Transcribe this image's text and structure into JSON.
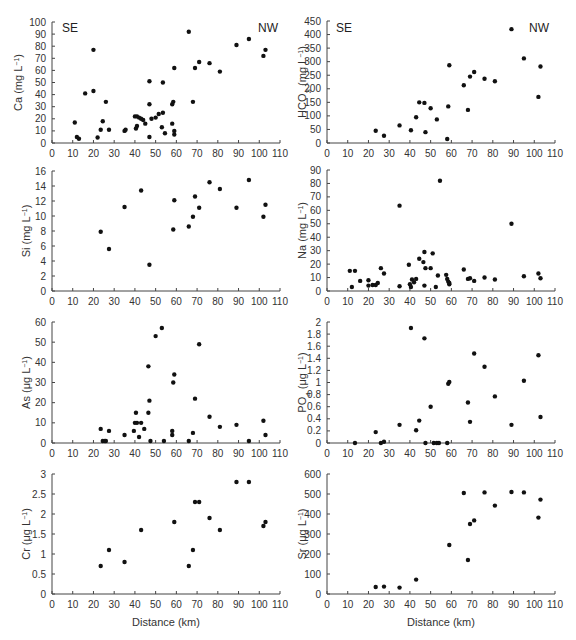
{
  "figure": {
    "xlabel": "Distance (km)",
    "corner_labels": {
      "left": "SE",
      "right": "NW"
    }
  },
  "chart_data": [
    {
      "id": "ca",
      "type": "scatter",
      "ylabel": "Ca (mg L⁻¹)",
      "ylabel_main": "Ca (mg L",
      "ylabel_sup": "−1",
      "ylabel_tail": ")",
      "xlabel": "",
      "xlim": [
        0,
        110
      ],
      "ylim": [
        0,
        100
      ],
      "xticks": [
        0,
        10,
        20,
        30,
        40,
        50,
        60,
        70,
        80,
        90,
        100,
        110
      ],
      "yticks": [
        0,
        10,
        20,
        30,
        40,
        50,
        60,
        70,
        80,
        90,
        100
      ],
      "annotations": [
        "SE",
        "NW"
      ],
      "points": [
        [
          11,
          17
        ],
        [
          12,
          5
        ],
        [
          13,
          3.5
        ],
        [
          16,
          41
        ],
        [
          20,
          77
        ],
        [
          20,
          43
        ],
        [
          22,
          4.5
        ],
        [
          23.5,
          11
        ],
        [
          24.5,
          18
        ],
        [
          26,
          34
        ],
        [
          27.5,
          11
        ],
        [
          35,
          10
        ],
        [
          35.5,
          11
        ],
        [
          40,
          22
        ],
        [
          40.5,
          12
        ],
        [
          41,
          14
        ],
        [
          41,
          22
        ],
        [
          42,
          21
        ],
        [
          43,
          20
        ],
        [
          44,
          19
        ],
        [
          45,
          16
        ],
        [
          47,
          32
        ],
        [
          47,
          5
        ],
        [
          47,
          51
        ],
        [
          48,
          20
        ],
        [
          50,
          21
        ],
        [
          51.5,
          24
        ],
        [
          53,
          13
        ],
        [
          53.5,
          25
        ],
        [
          53.5,
          50
        ],
        [
          54.5,
          8
        ],
        [
          58,
          16
        ],
        [
          58,
          32
        ],
        [
          58.5,
          34
        ],
        [
          59,
          10
        ],
        [
          59,
          7
        ],
        [
          59,
          62
        ],
        [
          66,
          92
        ],
        [
          68,
          34
        ],
        [
          69,
          62
        ],
        [
          71,
          67
        ],
        [
          76,
          66
        ],
        [
          81,
          59
        ],
        [
          89,
          81
        ],
        [
          95,
          86
        ],
        [
          102,
          72
        ],
        [
          103,
          77
        ]
      ]
    },
    {
      "id": "hco3",
      "type": "scatter",
      "ylabel_main": "HCO",
      "ylabel_sub": "3",
      "ylabel_rest": " (mg L",
      "ylabel_sup": "−1",
      "ylabel_tail": ")",
      "xlim": [
        0,
        110
      ],
      "ylim": [
        0,
        450
      ],
      "xticks": [
        0,
        10,
        20,
        30,
        40,
        50,
        60,
        70,
        80,
        90,
        100,
        110
      ],
      "yticks": [
        0,
        50,
        100,
        150,
        200,
        250,
        300,
        350,
        400,
        450
      ],
      "annotations": [
        "SE",
        "NW"
      ],
      "points": [
        [
          23.5,
          45
        ],
        [
          27.5,
          27
        ],
        [
          35,
          65
        ],
        [
          40.5,
          47
        ],
        [
          43,
          95
        ],
        [
          44.5,
          150
        ],
        [
          47,
          148
        ],
        [
          47.5,
          40
        ],
        [
          50,
          128
        ],
        [
          53,
          87
        ],
        [
          58,
          15
        ],
        [
          58.5,
          135
        ],
        [
          59,
          287
        ],
        [
          66,
          213
        ],
        [
          68,
          122
        ],
        [
          69,
          245
        ],
        [
          71,
          262
        ],
        [
          76,
          237
        ],
        [
          81,
          228
        ],
        [
          89,
          420
        ],
        [
          95,
          312
        ],
        [
          102,
          170
        ],
        [
          103,
          282
        ]
      ]
    },
    {
      "id": "si",
      "type": "scatter",
      "ylabel_main": "Si (mg L",
      "ylabel_sup": "−1",
      "ylabel_tail": ")",
      "xlim": [
        0,
        110
      ],
      "ylim": [
        0,
        16
      ],
      "xticks": [
        0,
        10,
        20,
        30,
        40,
        50,
        60,
        70,
        80,
        90,
        100,
        110
      ],
      "yticks": [
        0,
        2,
        4,
        6,
        8,
        10,
        12,
        14,
        16
      ],
      "points": [
        [
          23.5,
          7.9
        ],
        [
          27.5,
          5.6
        ],
        [
          35,
          11.2
        ],
        [
          43,
          13.4
        ],
        [
          47,
          3.5
        ],
        [
          58.5,
          8.2
        ],
        [
          59,
          12.1
        ],
        [
          66,
          8.6
        ],
        [
          68,
          9.9
        ],
        [
          69,
          12.6
        ],
        [
          71,
          11.1
        ],
        [
          76,
          14.5
        ],
        [
          81,
          13.6
        ],
        [
          89,
          11.1
        ],
        [
          95,
          14.8
        ],
        [
          102,
          9.9
        ],
        [
          103,
          11.5
        ]
      ]
    },
    {
      "id": "na",
      "type": "scatter",
      "ylabel_main": "Na (mg L",
      "ylabel_sup": "−1",
      "ylabel_tail": ")",
      "xlim": [
        0,
        110
      ],
      "ylim": [
        0,
        90
      ],
      "xticks": [
        0,
        10,
        20,
        30,
        40,
        50,
        60,
        70,
        80,
        90,
        100,
        110
      ],
      "yticks": [
        0,
        10,
        20,
        30,
        40,
        50,
        60,
        70,
        80,
        90
      ],
      "points": [
        [
          11,
          15
        ],
        [
          12,
          3
        ],
        [
          13.5,
          15
        ],
        [
          16,
          7.5
        ],
        [
          20,
          8
        ],
        [
          20,
          4
        ],
        [
          22,
          4.5
        ],
        [
          23.5,
          4.5
        ],
        [
          24.5,
          6
        ],
        [
          26,
          17
        ],
        [
          27.5,
          13
        ],
        [
          35,
          63.5
        ],
        [
          35,
          3.5
        ],
        [
          39.5,
          19.5
        ],
        [
          40,
          5
        ],
        [
          40.5,
          3
        ],
        [
          41,
          8.5
        ],
        [
          42,
          6.5
        ],
        [
          43,
          9
        ],
        [
          44.5,
          24
        ],
        [
          46.5,
          21.5
        ],
        [
          47,
          4
        ],
        [
          47,
          29
        ],
        [
          47.5,
          17
        ],
        [
          50,
          17
        ],
        [
          51,
          28
        ],
        [
          52.5,
          3
        ],
        [
          53.5,
          11.5
        ],
        [
          54.5,
          82
        ],
        [
          57.5,
          12
        ],
        [
          58,
          9
        ],
        [
          58.5,
          7
        ],
        [
          59,
          5
        ],
        [
          59,
          6
        ],
        [
          66,
          16
        ],
        [
          68,
          9
        ],
        [
          69,
          9.5
        ],
        [
          71,
          7.5
        ],
        [
          76,
          10
        ],
        [
          81,
          8.5
        ],
        [
          89,
          50
        ],
        [
          95,
          11
        ],
        [
          102,
          13
        ],
        [
          103,
          9.5
        ]
      ]
    },
    {
      "id": "as",
      "type": "scatter",
      "ylabel_main": "As (μg L",
      "ylabel_sup": "−1",
      "ylabel_tail": ")",
      "xlim": [
        0,
        110
      ],
      "ylim": [
        0,
        60
      ],
      "xticks": [
        0,
        10,
        20,
        30,
        40,
        50,
        60,
        70,
        80,
        90,
        100,
        110
      ],
      "yticks": [
        0,
        10,
        20,
        30,
        40,
        50,
        60
      ],
      "points": [
        [
          23.5,
          7
        ],
        [
          24.5,
          1
        ],
        [
          25.5,
          1
        ],
        [
          26,
          1
        ],
        [
          27.5,
          6
        ],
        [
          35,
          4
        ],
        [
          39.5,
          6
        ],
        [
          40,
          10
        ],
        [
          40.5,
          15
        ],
        [
          41,
          10
        ],
        [
          42,
          3
        ],
        [
          43,
          10
        ],
        [
          44.5,
          7
        ],
        [
          46.5,
          15
        ],
        [
          46.5,
          38
        ],
        [
          47,
          21
        ],
        [
          47.5,
          1
        ],
        [
          50,
          53
        ],
        [
          53,
          57
        ],
        [
          54,
          1
        ],
        [
          58,
          6
        ],
        [
          58,
          4
        ],
        [
          58.5,
          30
        ],
        [
          59,
          34
        ],
        [
          66,
          1
        ],
        [
          68,
          5
        ],
        [
          69,
          22
        ],
        [
          71,
          49
        ],
        [
          76,
          13
        ],
        [
          81,
          8
        ],
        [
          89,
          9
        ],
        [
          95,
          1
        ],
        [
          102,
          11
        ],
        [
          103,
          4
        ]
      ]
    },
    {
      "id": "po4",
      "type": "scatter",
      "ylabel_main": "PO",
      "ylabel_sub": "4",
      "ylabel_rest": " (μg L",
      "ylabel_sup": "−1",
      "ylabel_tail": ")",
      "xlim": [
        0,
        110
      ],
      "ylim": [
        0,
        2
      ],
      "xticks": [
        0,
        10,
        20,
        30,
        40,
        50,
        60,
        70,
        80,
        90,
        100,
        110
      ],
      "yticks": [
        0,
        0.2,
        0.4,
        0.6,
        0.8,
        1,
        1.2,
        1.4,
        1.6,
        1.8,
        2
      ],
      "points": [
        [
          13.5,
          0
        ],
        [
          23.5,
          0.18
        ],
        [
          26,
          0
        ],
        [
          27.5,
          0.02
        ],
        [
          35,
          0.3
        ],
        [
          40.5,
          1.9
        ],
        [
          43,
          0.21
        ],
        [
          44.5,
          0.37
        ],
        [
          47,
          1.73
        ],
        [
          47.5,
          0
        ],
        [
          50,
          0.6
        ],
        [
          51.5,
          0
        ],
        [
          53,
          0
        ],
        [
          54,
          0
        ],
        [
          58,
          0
        ],
        [
          58.5,
          0.98
        ],
        [
          59,
          1.01
        ],
        [
          68,
          0.67
        ],
        [
          69,
          0.35
        ],
        [
          71,
          1.48
        ],
        [
          76,
          1.26
        ],
        [
          81,
          0.77
        ],
        [
          89,
          0.3
        ],
        [
          95,
          1.03
        ],
        [
          102,
          1.45
        ],
        [
          103,
          0.43
        ]
      ]
    },
    {
      "id": "cr",
      "type": "scatter",
      "ylabel_main": "Cr (μg L",
      "ylabel_sup": "−1",
      "ylabel_tail": ")",
      "xlabel": "Distance (km)",
      "xlim": [
        0,
        110
      ],
      "ylim": [
        0,
        3
      ],
      "xticks": [
        0,
        10,
        20,
        30,
        40,
        50,
        60,
        70,
        80,
        90,
        100,
        110
      ],
      "yticks": [
        0,
        0.5,
        1,
        1.5,
        2,
        2.5,
        3
      ],
      "points": [
        [
          23.5,
          0.7
        ],
        [
          27.5,
          1.1
        ],
        [
          35,
          0.8
        ],
        [
          43,
          1.6
        ],
        [
          59,
          1.8
        ],
        [
          66,
          0.7
        ],
        [
          68,
          1.1
        ],
        [
          69,
          2.3
        ],
        [
          71,
          2.3
        ],
        [
          76,
          1.9
        ],
        [
          81,
          1.6
        ],
        [
          89,
          2.8
        ],
        [
          95,
          2.8
        ],
        [
          102,
          1.7
        ],
        [
          103,
          1.8
        ]
      ]
    },
    {
      "id": "sr",
      "type": "scatter",
      "ylabel_main": "Sr (μg L",
      "ylabel_sup": "−1",
      "ylabel_tail": ")",
      "xlabel": "Distance (km)",
      "xlim": [
        0,
        110
      ],
      "ylim": [
        0,
        600
      ],
      "xticks": [
        0,
        10,
        20,
        30,
        40,
        50,
        60,
        70,
        80,
        90,
        100,
        110
      ],
      "yticks": [
        0,
        100,
        200,
        300,
        400,
        500,
        600
      ],
      "points": [
        [
          23.5,
          35
        ],
        [
          27.5,
          37
        ],
        [
          35,
          32
        ],
        [
          43,
          72
        ],
        [
          59,
          245
        ],
        [
          66,
          505
        ],
        [
          68,
          170
        ],
        [
          69,
          350
        ],
        [
          71,
          368
        ],
        [
          76,
          508
        ],
        [
          81,
          442
        ],
        [
          89,
          510
        ],
        [
          95,
          508
        ],
        [
          102,
          382
        ],
        [
          103,
          472
        ]
      ]
    }
  ],
  "layout": {
    "panels": [
      {
        "id": "ca",
        "x0": 52,
        "x1": 280,
        "yTop": 22,
        "yBot": 143,
        "labelX": 14
      },
      {
        "id": "hco3",
        "x0": 327,
        "x1": 555,
        "yTop": 21,
        "yBot": 143,
        "labelX": 298
      },
      {
        "id": "si",
        "x0": 52,
        "x1": 280,
        "yTop": 171,
        "yBot": 291,
        "labelX": 22
      },
      {
        "id": "na",
        "x0": 327,
        "x1": 555,
        "yTop": 170,
        "yBot": 291,
        "labelX": 298
      },
      {
        "id": "as",
        "x0": 52,
        "x1": 280,
        "yTop": 322,
        "yBot": 443,
        "labelX": 22
      },
      {
        "id": "po4",
        "x0": 327,
        "x1": 555,
        "yTop": 322,
        "yBot": 443,
        "labelX": 298
      },
      {
        "id": "cr",
        "x0": 52,
        "x1": 280,
        "yTop": 474,
        "yBot": 594,
        "labelX": 22
      },
      {
        "id": "sr",
        "x0": 327,
        "x1": 555,
        "yTop": 474,
        "yBot": 594,
        "labelX": 298
      }
    ]
  }
}
